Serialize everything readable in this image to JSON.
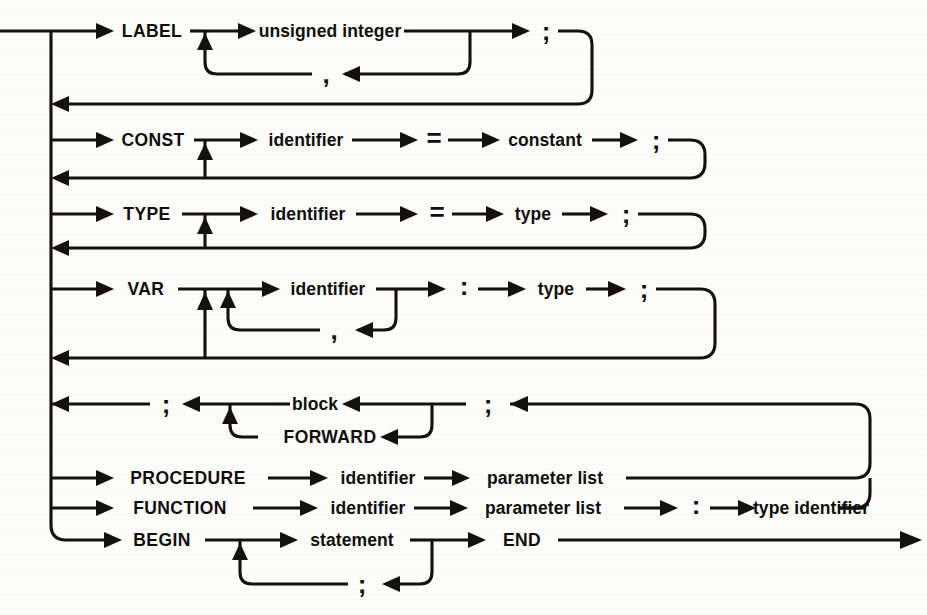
{
  "diagram": {
    "kind": "railroad-syntax-diagram",
    "ink_color": "#14100e",
    "background_color": "#fdfdfc",
    "nodes": {
      "label_kw": "LABEL",
      "unsigned_integer": "unsigned integer",
      "comma1": ",",
      "semi1": ";",
      "const_kw": "CONST",
      "identifier_const": "identifier",
      "equals_const": "=",
      "constant": "constant",
      "semi2": ";",
      "type_kw": "TYPE",
      "identifier_type": "identifier",
      "equals_type": "=",
      "type_word": "type",
      "semi3": ";",
      "var_kw": "VAR",
      "identifier_var": "identifier",
      "comma2": ",",
      "colon_var": ":",
      "type_var": "type",
      "semi4": ";",
      "semi_block_left": ";",
      "block": "block",
      "forward_kw": "FORWARD",
      "semi_block_right": ";",
      "procedure_kw": "PROCEDURE",
      "identifier_proc": "identifier",
      "parameter_list_proc": "parameter list",
      "function_kw": "FUNCTION",
      "identifier_func": "identifier",
      "parameter_list_func": "parameter list",
      "colon_func": ":",
      "type_identifier": "type identifier",
      "begin_kw": "BEGIN",
      "statement": "statement",
      "semi_stmt": ";",
      "end_kw": "END"
    },
    "rows": [
      {
        "id": "label-row",
        "label": "LABEL"
      },
      {
        "id": "const-row",
        "label": "CONST"
      },
      {
        "id": "type-row",
        "label": "TYPE"
      },
      {
        "id": "var-row",
        "label": "VAR"
      },
      {
        "id": "block-row",
        "label": "block / FORWARD"
      },
      {
        "id": "procedure-row",
        "label": "PROCEDURE"
      },
      {
        "id": "function-row",
        "label": "FUNCTION"
      },
      {
        "id": "begin-row",
        "label": "BEGIN"
      }
    ]
  }
}
